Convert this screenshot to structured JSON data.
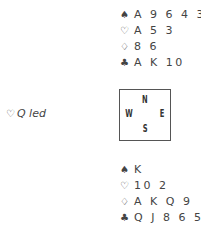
{
  "north": {
    "spades": "A 9 6 4 3",
    "hearts": "A 5 3",
    "diamonds": "8 6",
    "clubs": "A K 10"
  },
  "south": {
    "spades": "K",
    "hearts": "10 2",
    "diamonds": "A K Q 9",
    "clubs": "Q J 8 6 5 4"
  },
  "compass": {
    "n": "N",
    "s": "S",
    "w": "W",
    "e": "E"
  },
  "lead": {
    "suit": "♡",
    "text": "Q led"
  },
  "suits": {
    "spade": "♠",
    "heart": "♡",
    "diamond": "♢",
    "club": "♣"
  }
}
